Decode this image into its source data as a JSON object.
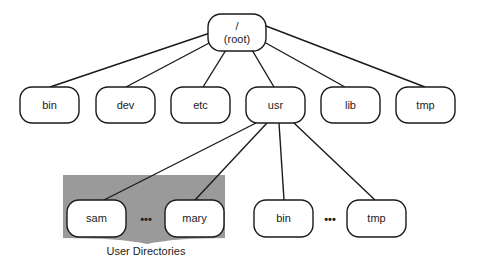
{
  "diagram": {
    "title": "",
    "type": "directory-tree",
    "colors": {
      "background": "#ffffff",
      "node_fill": "#ffffff",
      "node_stroke": "#1a1a1a",
      "edge": "#1a1a1a",
      "group_fill": "#9a9a9a"
    },
    "root": {
      "label_line1": "/",
      "label_line2": "(root)"
    },
    "level1": [
      {
        "id": "bin",
        "label": "bin"
      },
      {
        "id": "dev",
        "label": "dev"
      },
      {
        "id": "etc",
        "label": "etc"
      },
      {
        "id": "usr",
        "label": "usr"
      },
      {
        "id": "lib",
        "label": "lib"
      },
      {
        "id": "tmp",
        "label": "tmp"
      }
    ],
    "usr_children": [
      {
        "id": "sam",
        "label": "sam"
      },
      {
        "id": "mary",
        "label": "mary"
      },
      {
        "id": "usr-bin",
        "label": "bin"
      },
      {
        "id": "usr-tmp",
        "label": "tmp"
      }
    ],
    "ellipsis": "•••",
    "group_label": "User Directories",
    "edges": [
      [
        "/",
        "bin"
      ],
      [
        "/",
        "dev"
      ],
      [
        "/",
        "etc"
      ],
      [
        "/",
        "usr"
      ],
      [
        "/",
        "lib"
      ],
      [
        "/",
        "tmp"
      ],
      [
        "usr",
        "sam"
      ],
      [
        "usr",
        "mary"
      ],
      [
        "usr",
        "usr-bin"
      ],
      [
        "usr",
        "usr-tmp"
      ]
    ]
  }
}
